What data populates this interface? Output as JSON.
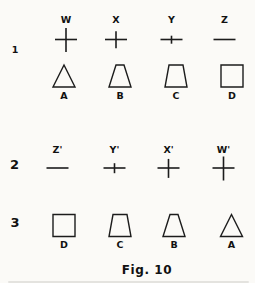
{
  "figure": {
    "caption": "Fig. 10",
    "ink_color": "#1c1c1c",
    "background_color": "#fbfaf7",
    "rows": [
      {
        "row_label": "1",
        "lines": [
          {
            "kind": "crosses",
            "label_position": "above",
            "items": [
              {
                "label": "W",
                "bar_width": 22,
                "vertical_length": 24
              },
              {
                "label": "X",
                "bar_width": 22,
                "vertical_length": 17
              },
              {
                "label": "Y",
                "bar_width": 22,
                "vertical_length": 8
              },
              {
                "label": "Z",
                "bar_width": 22,
                "vertical_length": 0
              }
            ]
          },
          {
            "kind": "shapes",
            "label_position": "below",
            "items": [
              {
                "label": "A",
                "shape": "triangle",
                "top_width": 0,
                "base_width": 22,
                "height": 22
              },
              {
                "label": "B",
                "shape": "trapezoid",
                "top_width": 8,
                "base_width": 22,
                "height": 22
              },
              {
                "label": "C",
                "shape": "trapezoid",
                "top_width": 14,
                "base_width": 22,
                "height": 22
              },
              {
                "label": "D",
                "shape": "square",
                "top_width": 22,
                "base_width": 22,
                "height": 22
              }
            ]
          }
        ]
      },
      {
        "row_label": "2",
        "lines": [
          {
            "kind": "crosses",
            "label_position": "above",
            "items": [
              {
                "label": "Z'",
                "bar_width": 22,
                "vertical_length": 0
              },
              {
                "label": "Y'",
                "bar_width": 22,
                "vertical_length": 10
              },
              {
                "label": "X'",
                "bar_width": 22,
                "vertical_length": 19
              },
              {
                "label": "W'",
                "bar_width": 22,
                "vertical_length": 24
              }
            ]
          }
        ]
      },
      {
        "row_label": "3",
        "lines": [
          {
            "kind": "shapes",
            "label_position": "below",
            "items": [
              {
                "label": "D",
                "shape": "square",
                "top_width": 22,
                "base_width": 22,
                "height": 22
              },
              {
                "label": "C",
                "shape": "trapezoid",
                "top_width": 14,
                "base_width": 22,
                "height": 22
              },
              {
                "label": "B",
                "shape": "trapezoid",
                "top_width": 8,
                "base_width": 22,
                "height": 22
              },
              {
                "label": "A",
                "shape": "triangle",
                "top_width": 0,
                "base_width": 22,
                "height": 22
              }
            ]
          }
        ]
      }
    ]
  }
}
